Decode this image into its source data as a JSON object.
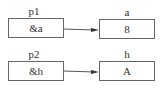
{
  "diagram": {
    "rows": [
      {
        "pointer": {
          "name": "p1",
          "value": "&a"
        },
        "target": {
          "name": "a",
          "value": "8"
        }
      },
      {
        "pointer": {
          "name": "p2",
          "value": "&h"
        },
        "target": {
          "name": "h",
          "value": "A"
        }
      }
    ],
    "colors": {
      "line": "#555555",
      "border": "#666666",
      "text": "#333333"
    }
  }
}
